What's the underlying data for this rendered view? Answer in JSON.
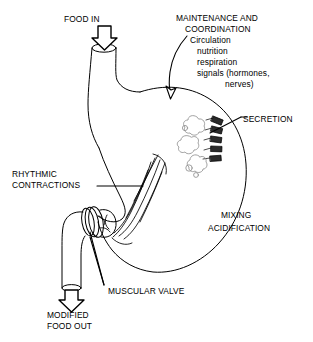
{
  "figure": {
    "background_color": "#ffffff",
    "line_color": "#000000"
  },
  "labels": {
    "food_in": "FOOD IN",
    "maintenance": "MAINTENANCE AND",
    "coordination": "COORDINATION",
    "circulation": "Circulation",
    "nutrition": "nutrition",
    "respiration": "respiration",
    "signals": "signals (hormones,",
    "nerves": "nerves)",
    "secretion": "SECRETION",
    "rhythmic": "RHYTHMIC",
    "contractions": "CONTRACTIONS",
    "mixing": "MIXING",
    "acidification": "ACIDIFICATION",
    "muscular_valve": "MUSCULAR VALVE",
    "modified": "MODIFIED",
    "food_out": "FOOD OUT"
  },
  "parts": {
    "esophagus": "esophagus-tube",
    "stomach_body": "stomach-outline",
    "gastric_glands": "secretion-glands",
    "muscle_fibers": "rhythmic-contraction-muscle-fibers",
    "pyloric_valve": "pyloric-muscular-valve",
    "duodenum": "duodenum-tube",
    "inlet_arrow": "food-in-arrow",
    "outlet_arrow": "modified-food-out-arrow",
    "coordination_arrow": "maintenance-coordination-curved-arrow",
    "secretion_leader": "secretion-leader-line",
    "contractions_leader": "rhythmic-contractions-leader-line",
    "valve_leader": "muscular-valve-leader-line"
  }
}
